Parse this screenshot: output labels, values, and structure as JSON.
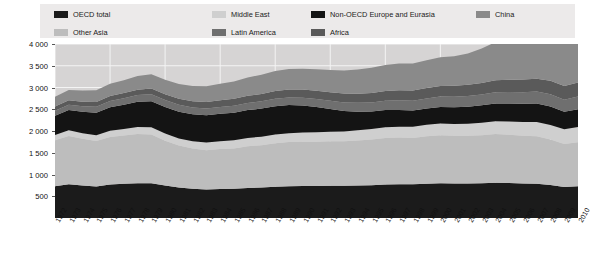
{
  "legend": {
    "background_color": "#eceaea",
    "rows": [
      [
        {
          "label": "OECD total",
          "color": "#1b1b1b",
          "x": 14
        },
        {
          "label": "Middle East",
          "color": "#cfcfcf",
          "x": 172
        },
        {
          "label": "Non-OECD Europe and Eurasia",
          "color": "#141414",
          "x": 271
        },
        {
          "label": "China",
          "color": "#8a8a8a",
          "x": 436
        }
      ],
      [
        {
          "label": "Other Asia",
          "color": "#bdbdbd",
          "x": 14
        },
        {
          "label": "Latin America",
          "color": "#6f6f6f",
          "x": 172
        },
        {
          "label": "Africa",
          "color": "#5a5a5a",
          "x": 271
        }
      ]
    ]
  },
  "axes": {
    "y_ticks": [
      "4 000",
      "3 500",
      "3 000",
      "2 500",
      "2 000",
      "1 500",
      "1 000",
      "500"
    ],
    "y_values": [
      4000,
      3500,
      3000,
      2500,
      2000,
      1500,
      1000,
      500
    ],
    "y_min": 0,
    "y_max": 4000,
    "x_ticks": [
      "1972",
      "1973",
      "1974",
      "1975",
      "1976",
      "1977",
      "1978",
      "1979",
      "1980",
      "1981",
      "1982",
      "1983",
      "1984",
      "1985",
      "1986",
      "1987",
      "1988",
      "1989",
      "1990",
      "1991",
      "1992",
      "1993",
      "1994",
      "1995",
      "1996",
      "1997",
      "1998",
      "1999",
      "2000",
      "2001",
      "2002",
      "2003",
      "2004",
      "2005",
      "2006",
      "2007",
      "2008",
      "2009",
      "2010"
    ]
  },
  "colors": {
    "plot_background": "#d6d4d4",
    "gridline": "#f4f4f4",
    "oecd_total": "#1b1b1b",
    "other_asia": "#bdbdbd",
    "middle_east": "#cfcfcf",
    "latin_america": "#6f6f6f",
    "non_oecd_europe_eurasia": "#141414",
    "africa": "#5a5a5a",
    "china": "#8a8a8a"
  },
  "chart_data": {
    "type": "area",
    "title": "",
    "subtitle": "",
    "xlabel": "",
    "ylabel": "",
    "ylim": [
      0,
      4000
    ],
    "grid": true,
    "legend_position": "top",
    "stacked": true,
    "x": [
      1972,
      1973,
      1974,
      1975,
      1976,
      1977,
      1978,
      1979,
      1980,
      1981,
      1982,
      1983,
      1984,
      1985,
      1986,
      1987,
      1988,
      1989,
      1990,
      1991,
      1992,
      1993,
      1994,
      1995,
      1996,
      1997,
      1998,
      1999,
      2000,
      2001,
      2002,
      2003,
      2004,
      2005,
      2006,
      2007,
      2008,
      2009,
      2010
    ],
    "categories": [
      "1972",
      "1973",
      "1974",
      "1975",
      "1976",
      "1977",
      "1978",
      "1979",
      "1980",
      "1981",
      "1982",
      "1983",
      "1984",
      "1985",
      "1986",
      "1987",
      "1988",
      "1989",
      "1990",
      "1991",
      "1992",
      "1993",
      "1994",
      "1995",
      "1996",
      "1997",
      "1998",
      "1999",
      "2000",
      "2001",
      "2002",
      "2003",
      "2004",
      "2005",
      "2006",
      "2007",
      "2008",
      "2009",
      "2010"
    ],
    "series": [
      {
        "name": "OECD total",
        "color": "#1b1b1b",
        "values": [
          730,
          775,
          750,
          725,
          770,
          785,
          800,
          800,
          745,
          700,
          670,
          655,
          665,
          670,
          690,
          700,
          720,
          730,
          735,
          735,
          740,
          740,
          745,
          755,
          770,
          775,
          775,
          790,
          800,
          795,
          795,
          800,
          810,
          805,
          795,
          790,
          760,
          715,
          730
        ]
      },
      {
        "name": "Other Asia",
        "color": "#bdbdbd",
        "values": [
          1060,
          1110,
          1070,
          1045,
          1090,
          1110,
          1130,
          1120,
          1030,
          965,
          925,
          905,
          920,
          930,
          960,
          975,
          1000,
          1015,
          1020,
          1020,
          1025,
          1025,
          1035,
          1050,
          1070,
          1075,
          1065,
          1090,
          1105,
          1095,
          1095,
          1105,
          1120,
          1110,
          1095,
          1090,
          1045,
          985,
          1010
        ]
      },
      {
        "name": "Middle East",
        "color": "#cfcfcf",
        "values": [
          120,
          130,
          130,
          135,
          145,
          150,
          160,
          165,
          165,
          165,
          170,
          175,
          180,
          185,
          190,
          195,
          200,
          205,
          210,
          215,
          220,
          225,
          235,
          240,
          245,
          250,
          255,
          262,
          268,
          272,
          278,
          285,
          295,
          305,
          315,
          325,
          335,
          340,
          350
        ]
      },
      {
        "name": "Non-OECD Europe and Eurasia",
        "color": "#141414",
        "values": [
          440,
          465,
          490,
          515,
          540,
          560,
          580,
          600,
          610,
          615,
          620,
          625,
          630,
          635,
          640,
          645,
          650,
          645,
          620,
          580,
          520,
          470,
          430,
          405,
          395,
          385,
          375,
          375,
          380,
          385,
          392,
          400,
          410,
          415,
          420,
          425,
          425,
          400,
          412
        ]
      },
      {
        "name": "Latin America",
        "color": "#6f6f6f",
        "values": [
          118,
          125,
          130,
          135,
          142,
          148,
          155,
          160,
          160,
          158,
          156,
          155,
          158,
          160,
          164,
          168,
          172,
          176,
          180,
          184,
          190,
          196,
          202,
          208,
          215,
          222,
          228,
          232,
          238,
          240,
          244,
          248,
          256,
          262,
          268,
          276,
          282,
          280,
          292
        ]
      },
      {
        "name": "Africa",
        "color": "#5a5a5a",
        "values": [
          95,
          100,
          105,
          110,
          115,
          120,
          126,
          132,
          136,
          140,
          145,
          150,
          155,
          160,
          165,
          170,
          176,
          182,
          188,
          193,
          198,
          204,
          210,
          216,
          222,
          228,
          234,
          240,
          246,
          252,
          258,
          266,
          274,
          282,
          290,
          298,
          306,
          312,
          322
        ]
      },
      {
        "name": "China",
        "color": "#8a8a8a",
        "values": [
          225,
          240,
          255,
          270,
          285,
          295,
          315,
          330,
          335,
          340,
          350,
          362,
          380,
          400,
          420,
          440,
          460,
          470,
          478,
          490,
          510,
          530,
          555,
          580,
          600,
          615,
          620,
          640,
          660,
          680,
          720,
          790,
          880,
          950,
          1020,
          1090,
          1130,
          1180,
          1290
        ]
      }
    ],
    "totals_note": "stacked totals rise from about 2 790 in 1972 to about 4 400 in 2010"
  }
}
